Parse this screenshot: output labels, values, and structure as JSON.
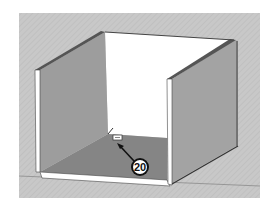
{
  "scene": {
    "type": "3d-model-viewport",
    "subject": "open box / cabinet carcass",
    "colors": {
      "background": "#c8c8c8",
      "hatch": "#bdbdbd",
      "back_wall": "#ffffff",
      "side_wall": "#9d9d9d",
      "side_wall_right": "#a3a3a3",
      "floor": "#858585",
      "edge": "#ffffff",
      "outline": "#3a3a3a",
      "ground_line": "#8a8a8a"
    }
  },
  "cursor": {
    "icon": "tape-measure-cursor"
  },
  "callout": {
    "label": "20",
    "arrow_icon": "arrow-up-left"
  }
}
